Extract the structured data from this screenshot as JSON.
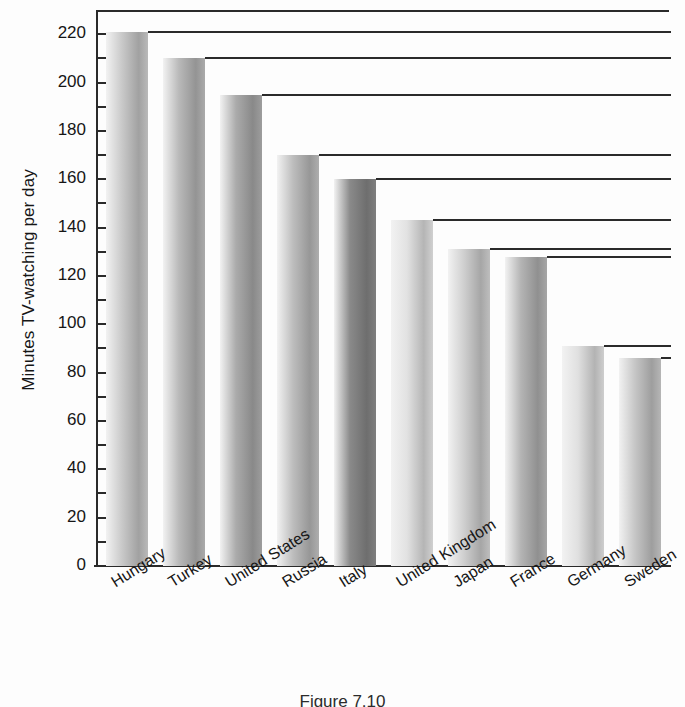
{
  "chart_data": {
    "type": "bar",
    "title": "",
    "xlabel": "",
    "ylabel": "Minutes TV-watching per day",
    "ylim": [
      0,
      230
    ],
    "ytick_step": 20,
    "yticks": [
      0,
      20,
      40,
      60,
      80,
      100,
      120,
      140,
      160,
      180,
      200,
      220
    ],
    "minor_tick_step": 10,
    "grid": false,
    "bar_top_rules": true,
    "orientation": "vertical",
    "categories": [
      "Hungary",
      "Turkey",
      "United States",
      "Russia",
      "Italy",
      "United Kingdom",
      "Japan",
      "France",
      "Germany",
      "Sweden"
    ],
    "values": [
      221,
      210,
      195,
      170,
      160,
      143,
      131,
      128,
      91,
      86
    ],
    "bar_shades": [
      "#c9c9c9",
      "#b9b9b9",
      "#ababab",
      "#bdbdbd",
      "#8a8a8a",
      "#e2e2e2",
      "#cfcfcf",
      "#b4b4b4",
      "#e0e0e0",
      "#c6c6c6"
    ],
    "legend": [],
    "annotations": []
  },
  "axis": {
    "y_title": "Minutes TV-watching per day",
    "tick_labels": [
      "220",
      "200",
      "180",
      "160",
      "140",
      "120",
      "100",
      "80",
      "60",
      "40",
      "20",
      "0"
    ]
  },
  "caption": {
    "text": "Figure 7.10"
  }
}
